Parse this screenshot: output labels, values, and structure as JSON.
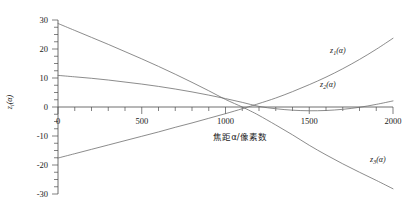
{
  "chart_data": {
    "type": "line",
    "title": "",
    "xlabel": "焦距α/像素数",
    "ylabel": "zᵢ(α)",
    "xlim": [
      0,
      2000
    ],
    "ylim": [
      -30,
      30
    ],
    "grid": false,
    "legend_position": "inline-annotations",
    "xticks": [
      0,
      500,
      1000,
      1500,
      2000
    ],
    "xtick_labels": [
      "0",
      "500",
      "1000",
      "1500",
      "2000"
    ],
    "xminor_step": 100,
    "yticks": [
      30,
      20,
      10,
      0,
      -10,
      -20,
      -30
    ],
    "ytick_labels": [
      "30",
      "20",
      "10",
      "0",
      "-10",
      "-20",
      "-30"
    ],
    "yminor_step": 2.5,
    "series": [
      {
        "name": "z₁(α)",
        "label": "z1",
        "label_sub": "1",
        "color": "#6e6e6e",
        "annotation_x": 330,
        "annotation_y": 19.5,
        "x": [
          0,
          100,
          200,
          300,
          400,
          500,
          600,
          700,
          800,
          900,
          1000,
          1100,
          1150,
          1200,
          1300,
          1400,
          1500,
          1600,
          1700,
          1800,
          1900,
          2000
        ],
        "y": [
          28.8,
          26.4,
          24.0,
          21.6,
          19.1,
          16.6,
          14.0,
          11.3,
          8.5,
          5.6,
          2.6,
          0.0,
          -1.4,
          -2.9,
          -6.2,
          -9.6,
          -13.2,
          -16.5,
          -19.6,
          -22.5,
          -25.3,
          -28.2
        ]
      },
      {
        "name": "z₂(α)",
        "label": "z2",
        "label_sub": "2",
        "color": "#6e6e6e",
        "annotation_x": 320,
        "annotation_y": 7.8,
        "x": [
          0,
          100,
          200,
          300,
          400,
          500,
          600,
          700,
          800,
          900,
          1000,
          1100,
          1200,
          1300,
          1400,
          1500,
          1600,
          1700,
          1800,
          1900,
          2000
        ],
        "y": [
          10.9,
          10.4,
          9.9,
          9.3,
          8.6,
          7.9,
          7.1,
          6.2,
          5.2,
          4.1,
          2.9,
          1.6,
          0.2,
          -0.6,
          -1.1,
          -1.3,
          -1.2,
          -0.8,
          -0.1,
          0.9,
          2.1
        ]
      },
      {
        "name": "z₃(α)",
        "label": "z3",
        "label_sub": "3",
        "color": "#6e6e6e",
        "annotation_x": 370,
        "annotation_y": -18.0,
        "x": [
          0,
          100,
          200,
          300,
          400,
          500,
          600,
          700,
          800,
          900,
          1000,
          1100,
          1150,
          1200,
          1300,
          1400,
          1500,
          1600,
          1700,
          1800,
          1900,
          2000
        ],
        "y": [
          -17.6,
          -16.1,
          -14.6,
          -13.1,
          -11.6,
          -10.1,
          -8.6,
          -7.0,
          -5.5,
          -3.9,
          -2.3,
          -0.6,
          0.3,
          1.2,
          3.1,
          5.3,
          7.7,
          10.3,
          13.2,
          16.4,
          19.9,
          23.7
        ]
      }
    ]
  },
  "axis_labels": {
    "y_main": "z",
    "y_sub": "i",
    "y_arg": "(α)",
    "x_text": "焦距α/像素数"
  }
}
